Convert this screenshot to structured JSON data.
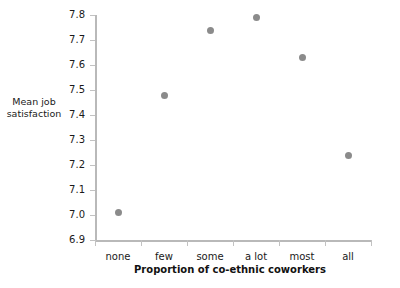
{
  "chart_data": {
    "type": "scatter",
    "title": "",
    "xlabel": "Proportion of co-ethnic coworkers",
    "ylabel": "Mean job\nsatisfaction",
    "categories": [
      "none",
      "few",
      "some",
      "a lot",
      "most",
      "all"
    ],
    "values": [
      7.01,
      7.48,
      7.74,
      7.79,
      7.63,
      7.24
    ],
    "series": [
      {
        "name": "Mean job satisfaction",
        "values": [
          7.01,
          7.48,
          7.74,
          7.79,
          7.63,
          7.24
        ]
      }
    ],
    "ylim": [
      6.9,
      7.8
    ],
    "yticks": [
      7.8,
      7.7,
      7.6,
      7.5,
      7.4,
      7.3,
      7.2,
      7.1,
      7.0,
      6.9
    ],
    "ytick_labels": [
      "7.8",
      "7.7",
      "7.6",
      "7.5",
      "7.4",
      "7.3",
      "7.2",
      "7.1",
      "7.0",
      "6.9"
    ],
    "xtick_labels": [
      "none",
      "few",
      "some",
      "a lot",
      "most",
      "all"
    ],
    "grid": false,
    "legend": false,
    "legend_position": "none",
    "marker_color": "#8b8b8b",
    "axis_color": "#b9b9b9",
    "text_color": "#1a1a1a"
  }
}
